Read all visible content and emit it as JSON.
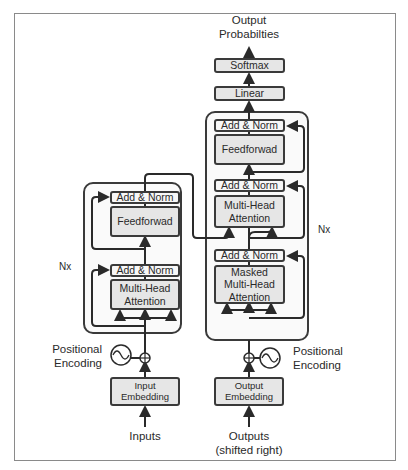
{
  "title": {
    "output_line1": "Output",
    "output_line2": "Probabilties"
  },
  "decoder_head": {
    "softmax": "Softmax",
    "linear": "Linear"
  },
  "decoder": {
    "add_norm_top": "Add & Norm",
    "feedforward": "Feedforwad",
    "add_norm_mid": "Add & Norm",
    "mha_line1": "Multi-Head",
    "mha_line2": "Attention",
    "add_norm_bottom": "Add & Norm",
    "masked_line1": "Masked",
    "masked_line2": "Multi-Head",
    "masked_line3": "Attention",
    "repeat": "Nx"
  },
  "encoder": {
    "add_norm_top": "Add & Norm",
    "feedforward": "Feedforwad",
    "add_norm_bottom": "Add & Norm",
    "mha_line1": "Multi-Head",
    "mha_line2": "Attention",
    "repeat": "Nx"
  },
  "encoder_input": {
    "pos_enc_line1": "Positional",
    "pos_enc_line2": "Encoding",
    "embedding_line1": "Input",
    "embedding_line2": "Embedding",
    "inputs": "Inputs"
  },
  "decoder_input": {
    "pos_enc_line1": "Positional",
    "pos_enc_line2": "Encoding",
    "embedding_line1": "Output",
    "embedding_line2": "Embedding",
    "outputs_line1": "Outputs",
    "outputs_line2": "(shifted right)"
  },
  "colors": {
    "box_fill": "#e6e6e6",
    "norm_fill": "#f7f7f7",
    "stroke": "#3a3a3a",
    "block_fill": "#fafafa"
  }
}
